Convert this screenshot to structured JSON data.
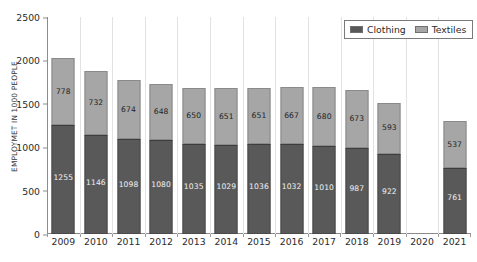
{
  "chart_data": {
    "type": "bar",
    "subtype": "stacked-column",
    "title": "",
    "xlabel": "",
    "ylabel": "EMPLOYMET IN 1000 PEOPLE",
    "ylim": [
      0,
      2500
    ],
    "yticks": [
      0,
      500,
      1000,
      1500,
      2000,
      2500
    ],
    "grid": "vertical-separators-only",
    "legend_position": "top-right",
    "categories": [
      "2009",
      "2010",
      "2011",
      "2012",
      "2013",
      "2014",
      "2015",
      "2016",
      "2017",
      "2018",
      "2019",
      "2020",
      "2021"
    ],
    "series": [
      {
        "name": "Clothing",
        "color": "#595959",
        "values": [
          1255,
          1146,
          1098,
          1080,
          1035,
          1029,
          1036,
          1032,
          1010,
          987,
          922,
          null,
          761
        ]
      },
      {
        "name": "Textiles",
        "color": "#a6a6a6",
        "values": [
          778,
          732,
          674,
          648,
          650,
          651,
          651,
          667,
          680,
          673,
          593,
          null,
          537
        ]
      }
    ],
    "totals": [
      2033,
      1878,
      1772,
      1728,
      1685,
      1680,
      1687,
      1699,
      1690,
      1660,
      1515,
      null,
      1298
    ]
  },
  "legend": {
    "items": [
      {
        "label": "Clothing",
        "swatch": "clothing"
      },
      {
        "label": "Textiles",
        "swatch": "textiles"
      }
    ]
  },
  "axis": {
    "y_tick_labels": [
      "2500",
      "2000",
      "1500",
      "1000",
      "500",
      "0"
    ],
    "x_tick_labels": [
      "2009",
      "2010",
      "2011",
      "2012",
      "2013",
      "2014",
      "2015",
      "2016",
      "2017",
      "2018",
      "2019",
      "2020",
      "2021"
    ]
  }
}
